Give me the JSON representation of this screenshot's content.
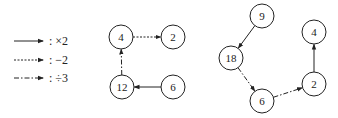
{
  "legend": [
    {
      "style": "solid",
      "label": ": ×2"
    },
    {
      "style": "dashed",
      "label": ": −2"
    },
    {
      "style": "dashdot",
      "label": ": ÷3"
    }
  ],
  "graph_left": {
    "nodes": [
      {
        "id": "a",
        "label": "4",
        "x": 121,
        "y": 37
      },
      {
        "id": "b",
        "label": "2",
        "x": 173,
        "y": 37
      },
      {
        "id": "c",
        "label": "12",
        "x": 122,
        "y": 87
      },
      {
        "id": "d",
        "label": "6",
        "x": 173,
        "y": 87
      }
    ],
    "edges": [
      {
        "from": "a",
        "to": "b",
        "style": "dashed",
        "op": "−2"
      },
      {
        "from": "d",
        "to": "c",
        "style": "solid",
        "op": "×2"
      },
      {
        "from": "c",
        "to": "a",
        "style": "dashdot",
        "op": "÷3"
      }
    ]
  },
  "graph_right": {
    "nodes": [
      {
        "id": "e",
        "label": "9",
        "x": 262,
        "y": 16
      },
      {
        "id": "f",
        "label": "18",
        "x": 231,
        "y": 58
      },
      {
        "id": "g",
        "label": "6",
        "x": 262,
        "y": 101
      },
      {
        "id": "h",
        "label": "2",
        "x": 314,
        "y": 84
      },
      {
        "id": "i",
        "label": "4",
        "x": 314,
        "y": 32
      }
    ],
    "edges": [
      {
        "from": "e",
        "to": "f",
        "style": "solid",
        "op": "×2"
      },
      {
        "from": "f",
        "to": "g",
        "style": "dashdot",
        "op": "÷3"
      },
      {
        "from": "g",
        "to": "h",
        "style": "dashdot",
        "op": "÷3"
      },
      {
        "from": "h",
        "to": "i",
        "style": "solid",
        "op": "×2"
      }
    ]
  }
}
